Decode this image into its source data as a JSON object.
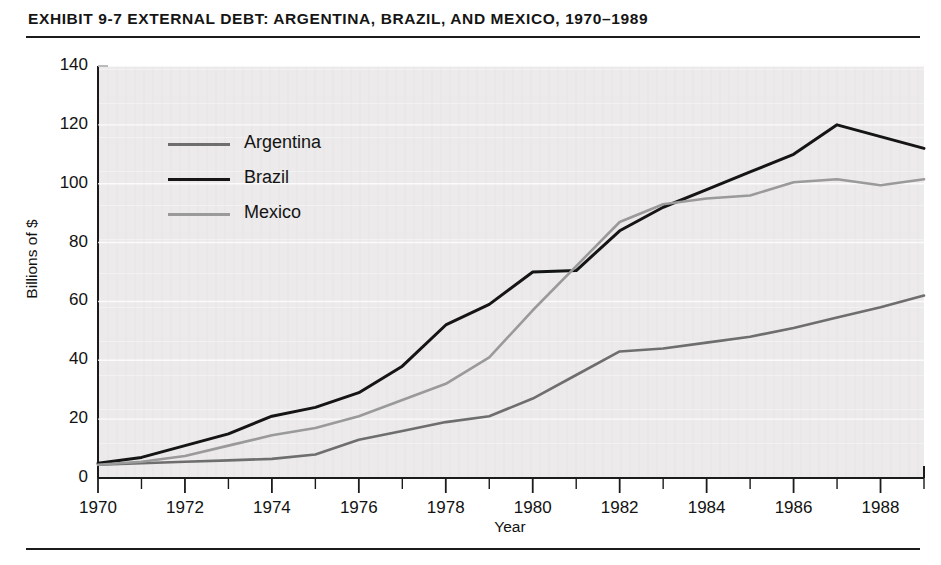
{
  "exhibit": {
    "title": "EXHIBIT 9-7   EXTERNAL DEBT: ARGENTINA, BRAZIL, AND MEXICO, 1970–1989"
  },
  "chart_data": {
    "type": "line",
    "title": "EXHIBIT 9-7   EXTERNAL DEBT: ARGENTINA, BRAZIL, AND MEXICO, 1970–1989",
    "xlabel": "Year",
    "ylabel": "Billions of $",
    "xlim": [
      1970,
      1989
    ],
    "ylim": [
      0,
      140
    ],
    "yticks": [
      0,
      20,
      40,
      60,
      80,
      100,
      120,
      140
    ],
    "ytick_labels": [
      "0",
      "20",
      "40",
      "60",
      "80",
      "100",
      "120",
      "140"
    ],
    "xticks": [
      1970,
      1972,
      1974,
      1976,
      1978,
      1980,
      1982,
      1984,
      1986,
      1988
    ],
    "xtick_labels": [
      "1970",
      "1972",
      "1974",
      "1976",
      "1978",
      "1980",
      "1982",
      "1984",
      "1986",
      "1988"
    ],
    "x_minor_ticks": [
      1971,
      1973,
      1975,
      1977,
      1979,
      1981,
      1983,
      1985,
      1987,
      1989
    ],
    "grid": false,
    "legend_position": "upper left",
    "x": [
      1970,
      1971,
      1972,
      1973,
      1974,
      1975,
      1976,
      1977,
      1978,
      1979,
      1980,
      1981,
      1982,
      1983,
      1984,
      1985,
      1986,
      1987,
      1988,
      1989
    ],
    "series": [
      {
        "name": "Argentina",
        "color": "#6e6e6e",
        "values": [
          4.5,
          5.0,
          5.5,
          6.0,
          6.5,
          8.0,
          13.0,
          16.0,
          19.0,
          21.0,
          27.0,
          35.0,
          43.0,
          44.0,
          46.0,
          48.0,
          51.0,
          54.5,
          58.0,
          62.0
        ]
      },
      {
        "name": "Brazil",
        "color": "#151515",
        "values": [
          5.0,
          7.0,
          11.0,
          15.0,
          21.0,
          24.0,
          29.0,
          38.0,
          52.0,
          59.0,
          70.0,
          70.5,
          84.0,
          92.0,
          98.0,
          104.0,
          110.0,
          120.0,
          116.0,
          112.0
        ]
      },
      {
        "name": "Mexico",
        "color": "#9a9a9a",
        "values": [
          4.5,
          5.5,
          7.5,
          11.0,
          14.5,
          17.0,
          21.0,
          26.5,
          32.0,
          41.0,
          57.0,
          72.0,
          87.0,
          93.0,
          95.0,
          96.0,
          100.5,
          101.5,
          99.5,
          101.5
        ]
      }
    ]
  },
  "legend": {
    "items": [
      {
        "label": "Argentina",
        "color": "#6e6e6e"
      },
      {
        "label": "Brazil",
        "color": "#151515"
      },
      {
        "label": "Mexico",
        "color": "#9a9a9a"
      }
    ]
  }
}
